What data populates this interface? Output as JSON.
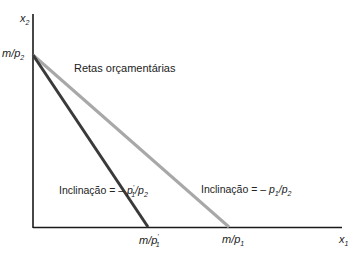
{
  "diagram": {
    "type": "budget-line-diagram",
    "axes": {
      "y_label": "x",
      "y_label_sub": "2",
      "x_label": "x",
      "x_label_sub": "1"
    },
    "intercepts": {
      "y": {
        "text": "m/p",
        "sub": "2"
      },
      "x_new": {
        "text": "m/p",
        "sub": "1",
        "prime": "'"
      },
      "x_old": {
        "text": "m/p",
        "sub": "1"
      }
    },
    "title_label": "Retas orçamentárias",
    "slope_new": {
      "prefix": "Inclinação = – ",
      "num": "p",
      "num_sub": "1",
      "num_prime": "'",
      "sep": "/",
      "den": "p",
      "den_sub": "2"
    },
    "slope_old": {
      "prefix": "Inclinação = – ",
      "num": "p",
      "num_sub": "1",
      "sep": "/",
      "den": "p",
      "den_sub": "2"
    },
    "colors": {
      "axis": "#1a1a1a",
      "line_new": "#3a3a3a",
      "line_old": "#a8a8a8"
    }
  }
}
